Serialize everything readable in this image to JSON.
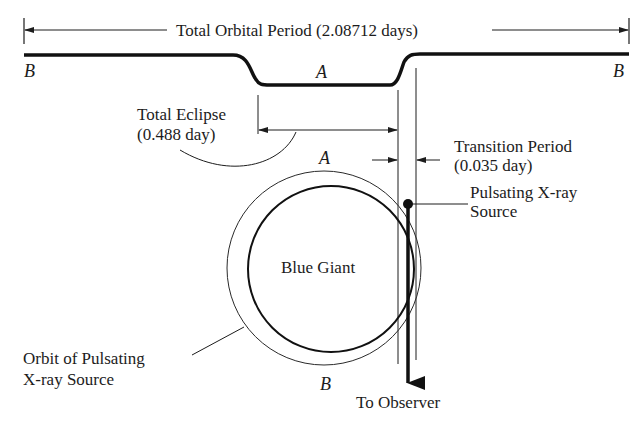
{
  "diagram": {
    "title": "Total Orbital Period (2.08712 days)",
    "light_curve": {
      "left_label": "B",
      "middle_label": "A",
      "right_label": "B"
    },
    "total_eclipse": {
      "line1": "Total Eclipse",
      "line2": "(0.488 day)"
    },
    "transition_period": {
      "line1": "Transition Period",
      "line2": "(0.035 day)"
    },
    "pulsating_source": {
      "line1": "Pulsating X-ray",
      "line2": "Source"
    },
    "blue_giant_label": "Blue Giant",
    "orbit_label": {
      "line1": "Orbit of Pulsating",
      "line2": "X-ray Source"
    },
    "orbit_point_top": "A",
    "orbit_point_bottom": "B",
    "observer_label": "To Observer"
  }
}
